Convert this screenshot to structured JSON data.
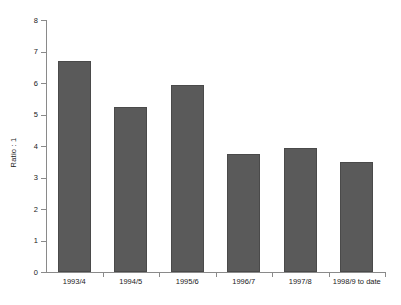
{
  "chart_data": {
    "type": "bar",
    "title": "",
    "xlabel": "",
    "ylabel": "Ratio : 1",
    "categories": [
      "1993/4",
      "1994/5",
      "1995/6",
      "1996/7",
      "1997/8",
      "1998/9 to date"
    ],
    "values": [
      6.7,
      5.25,
      5.95,
      3.75,
      3.95,
      3.5
    ],
    "ylim": [
      0,
      8
    ],
    "ytick_labels": [
      "0",
      "1",
      "2",
      "3",
      "4",
      "5",
      "6",
      "7",
      "8"
    ],
    "ytick_values": [
      0,
      1,
      2,
      3,
      4,
      5,
      6,
      7,
      8
    ],
    "grid": false,
    "legend": false,
    "bar_color": "#5a5a5a",
    "axis_color": "#8a8a8a",
    "background": "#ffffff"
  }
}
